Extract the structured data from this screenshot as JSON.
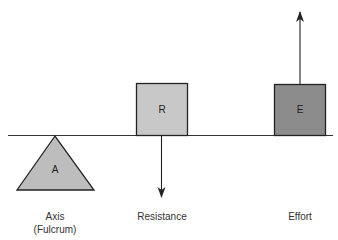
{
  "diagram": {
    "type": "first-class lever",
    "colors": {
      "background": "#ffffff",
      "stroke": "#222222",
      "beam": "#333333",
      "fulcrum_fill": "#bdbdbd",
      "resistance_fill": "#c8c8c8",
      "effort_fill": "#8c8c8c"
    },
    "fulcrum": {
      "label": "A",
      "caption_line1": "Axis",
      "caption_line2": "(Fulcrum)"
    },
    "resistance": {
      "label": "R",
      "caption": "Resistance",
      "arrow_direction": "down"
    },
    "effort": {
      "label": "E",
      "caption": "Effort",
      "arrow_direction": "up"
    }
  }
}
